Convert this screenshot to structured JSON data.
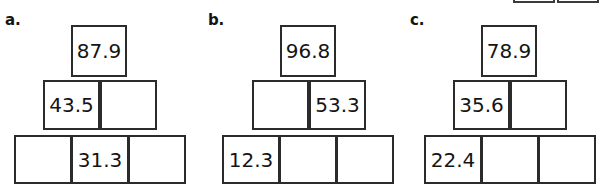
{
  "page": {
    "background_color": "#ffffff",
    "border_color": "#2b2b2b",
    "text_color": "#141414"
  },
  "clipped_boxes": [
    {
      "name": "clipped-box-left"
    },
    {
      "name": "clipped-box-right"
    }
  ],
  "problems": [
    {
      "label": "a.",
      "rows": [
        {
          "cells": [
            {
              "value": "87.9",
              "filled": true
            }
          ]
        },
        {
          "cells": [
            {
              "value": "43.5",
              "filled": true
            },
            {
              "value": "",
              "filled": false
            }
          ]
        },
        {
          "cells": [
            {
              "value": "",
              "filled": false
            },
            {
              "value": "31.3",
              "filled": true
            },
            {
              "value": "",
              "filled": false
            }
          ]
        }
      ]
    },
    {
      "label": "b.",
      "rows": [
        {
          "cells": [
            {
              "value": "96.8",
              "filled": true
            }
          ]
        },
        {
          "cells": [
            {
              "value": "",
              "filled": false
            },
            {
              "value": "53.3",
              "filled": true
            }
          ]
        },
        {
          "cells": [
            {
              "value": "12.3",
              "filled": true
            },
            {
              "value": "",
              "filled": false
            },
            {
              "value": "",
              "filled": false
            }
          ]
        }
      ]
    },
    {
      "label": "c.",
      "rows": [
        {
          "cells": [
            {
              "value": "78.9",
              "filled": true
            }
          ]
        },
        {
          "cells": [
            {
              "value": "35.6",
              "filled": true
            },
            {
              "value": "",
              "filled": false
            }
          ]
        },
        {
          "cells": [
            {
              "value": "22.4",
              "filled": true
            },
            {
              "value": "",
              "filled": false
            },
            {
              "value": "",
              "filled": false
            }
          ]
        }
      ]
    }
  ]
}
